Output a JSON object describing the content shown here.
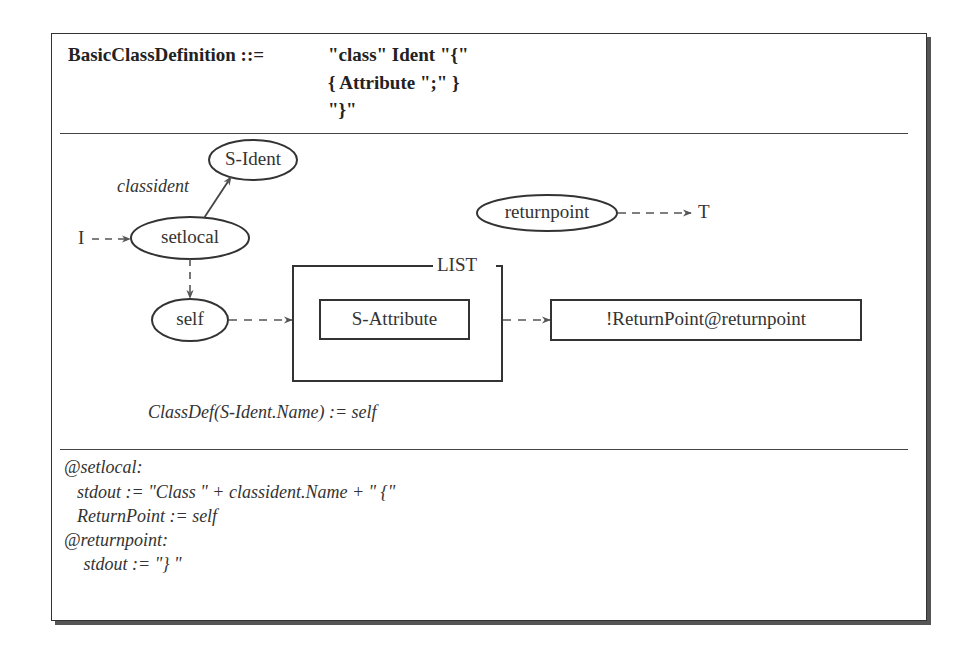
{
  "grammar": {
    "lhs": "BasicClassDefinition ::=",
    "rhs_lines": [
      "\"class\" Ident \"{\"",
      "{ Attribute \";\" }",
      "\"}\""
    ]
  },
  "diagram": {
    "nodes": {
      "s_ident": {
        "label": "S-Ident",
        "shape": "ellipse"
      },
      "setlocal": {
        "label": "setlocal",
        "shape": "ellipse"
      },
      "self": {
        "label": "self",
        "shape": "ellipse"
      },
      "returnpoint": {
        "label": "returnpoint",
        "shape": "ellipse"
      },
      "list": {
        "label": "LIST",
        "shape": "bracket-box"
      },
      "s_attribute": {
        "label": "S-Attribute",
        "shape": "rect"
      },
      "return_point_call": {
        "label": "!ReturnPoint@returnpoint",
        "shape": "rect"
      }
    },
    "labels": {
      "edge_classident": "classident",
      "input": "I",
      "terminal": "T"
    },
    "edges": [
      {
        "from": "I",
        "to": "setlocal",
        "style": "dashed"
      },
      {
        "from": "setlocal",
        "to": "S-Ident",
        "style": "solid",
        "label": "classident"
      },
      {
        "from": "setlocal",
        "to": "self",
        "style": "dashed"
      },
      {
        "from": "self",
        "to": "LIST",
        "style": "dashed"
      },
      {
        "from": "LIST",
        "to": "!ReturnPoint@returnpoint",
        "style": "dashed"
      },
      {
        "from": "returnpoint",
        "to": "T",
        "style": "dashed"
      }
    ],
    "assignment": "ClassDef(S-Ident.Name) := self"
  },
  "actions": {
    "lines": [
      "@setlocal:",
      "  stdout := \"Class \" + classident.Name + \" {\"",
      "  ReturnPoint := self",
      "@returnpoint:",
      "   stdout := \"} \""
    ]
  }
}
